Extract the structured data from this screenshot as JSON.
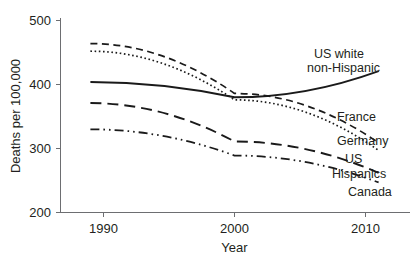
{
  "chart_data": {
    "type": "line",
    "title": "",
    "xlabel": "Year",
    "ylabel": "Deaths per 100,000",
    "xlim": [
      1988.5,
      2011.5
    ],
    "ylim": [
      200,
      500
    ],
    "xticks": [
      1990,
      2000,
      2010
    ],
    "xtick_labels": [
      "1990",
      "2000",
      "2010"
    ],
    "yticks": [
      200,
      300,
      400,
      500
    ],
    "ytick_labels": [
      "200",
      "300",
      "400",
      "500"
    ],
    "grid": false,
    "legend": "inline-labels-right",
    "x": [
      1989,
      2000,
      2011
    ],
    "series": [
      {
        "name": "US white non-Hispanic",
        "label": "US white",
        "label_line2": "non-Hispanic",
        "style": "solid",
        "values": [
          404,
          380,
          421
        ]
      },
      {
        "name": "France",
        "label": "France",
        "style": "dashed",
        "values": [
          464,
          386,
          309
        ]
      },
      {
        "name": "Germany",
        "label": "Germany",
        "style": "dotted",
        "values": [
          452,
          376,
          297
        ]
      },
      {
        "name": "US Hispanics",
        "label": "US",
        "label_line2": "Hispanics",
        "style": "long-dashed",
        "values": [
          371,
          311,
          262
        ]
      },
      {
        "name": "Canada",
        "label": "Canada",
        "style": "dash-dot-dot",
        "values": [
          330,
          289,
          247
        ]
      }
    ]
  },
  "axes": {
    "y_title": "Deaths per 100,000",
    "x_title": "Year",
    "y_tick_500": "500",
    "y_tick_400": "400",
    "y_tick_300": "300",
    "y_tick_200": "200",
    "x_tick_1990": "1990",
    "x_tick_2000": "2000",
    "x_tick_2010": "2010"
  },
  "annotations": {
    "us_white_line1": "US white",
    "us_white_line2": "non-Hispanic",
    "france": "France",
    "germany": "Germany",
    "us_hispanics_line1": "US",
    "us_hispanics_line2": "Hispanics",
    "canada": "Canada"
  },
  "colors": {
    "line": "#1a1a1a",
    "axis": "#6d6e71",
    "text": "#231f20",
    "background": "#ffffff"
  }
}
